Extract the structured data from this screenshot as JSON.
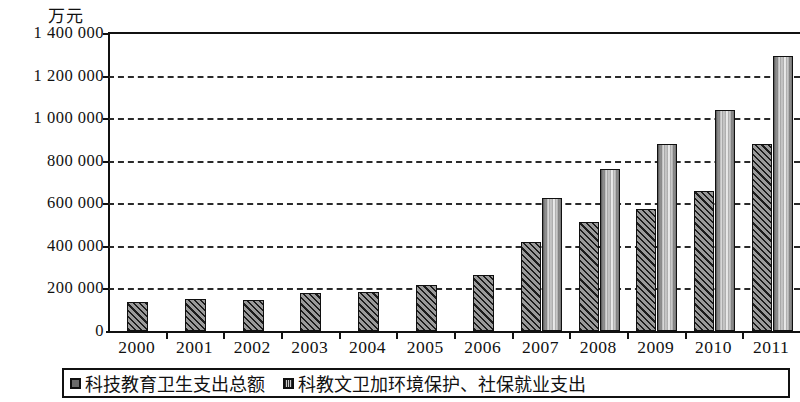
{
  "chart_data": {
    "type": "bar",
    "title": "",
    "unit_label": "万元",
    "xlabel": "",
    "ylabel": "万元",
    "ylim": [
      0,
      1400000
    ],
    "ytick_step": 200000,
    "grid": true,
    "legend_position": "bottom",
    "categories": [
      "2000",
      "2001",
      "2002",
      "2003",
      "2004",
      "2005",
      "2006",
      "2007",
      "2008",
      "2009",
      "2010",
      "2011"
    ],
    "ytick_labels": [
      "0",
      "200 000",
      "400 000",
      "600 000",
      "800 000",
      "1 000 000",
      "1 200 000",
      "1 400 000"
    ],
    "ytick_values": [
      0,
      200000,
      400000,
      600000,
      800000,
      1000000,
      1200000,
      1400000
    ],
    "series": [
      {
        "name": "科技教育卫生支出总额",
        "pattern": "diagonal-hatch-dark",
        "values": [
          135000,
          150000,
          148000,
          178000,
          183000,
          215000,
          265000,
          420000,
          510000,
          575000,
          660000,
          880000
        ]
      },
      {
        "name": "科教文卫加环境保护、社保就业支出",
        "pattern": "vertical-stripe-light",
        "values": [
          null,
          null,
          null,
          null,
          null,
          null,
          null,
          625000,
          760000,
          880000,
          1040000,
          1290000
        ]
      }
    ]
  },
  "legend": {
    "items": [
      {
        "label": "科技教育卫生支出总额",
        "swatch": "series-1-swatch"
      },
      {
        "label": "科教文卫加环境保护、社保就业支出",
        "swatch": "series-2-swatch"
      }
    ]
  },
  "colors": {
    "axis": "#111111",
    "grid": "#2a2a2a",
    "series1": "#5d5d5d",
    "series2": "#c6c6c6",
    "background": "#ffffff"
  }
}
